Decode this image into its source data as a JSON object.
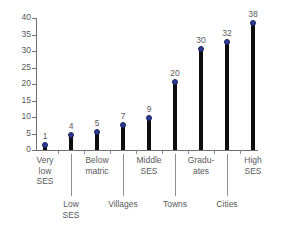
{
  "chart_data": {
    "type": "bar",
    "title": "",
    "subtitle": "",
    "xlabel": "",
    "ylabel": "",
    "ylim": [
      0,
      40
    ],
    "ytick_step": 5,
    "grid": false,
    "legend": "none",
    "marker_style": "circle",
    "categories": [
      "Very\nlow\nSES",
      "Low\nSES",
      "Below\nmatric",
      "Villages",
      "Middle\nSES",
      "Towns",
      "Gradu-\nates",
      "Cities",
      "High\nSES"
    ],
    "values": [
      1,
      4,
      5,
      7,
      9,
      20,
      30,
      32,
      38
    ],
    "yticks": [
      "0",
      "5",
      "10",
      "15",
      "20",
      "25",
      "30",
      "35",
      "40"
    ],
    "ytick_values": [
      0,
      5,
      10,
      15,
      20,
      25,
      30,
      35,
      40
    ],
    "data_labels": [
      "1",
      "4",
      "5",
      "7",
      "9",
      "20",
      "30",
      "32",
      "38"
    ],
    "top_row_labels": [
      {
        "text": "Very\nlow\nSES",
        "index": 0
      },
      {
        "text": "Below\nmatric",
        "index": 2
      },
      {
        "text": "Middle\nSES",
        "index": 4
      },
      {
        "text": "Gradu-\nates",
        "index": 6
      },
      {
        "text": "High\nSES",
        "index": 8
      }
    ],
    "bottom_row_labels": [
      {
        "text": "Low\nSES",
        "index": 1
      },
      {
        "text": "Villages",
        "index": 3
      },
      {
        "text": "Towns",
        "index": 5
      },
      {
        "text": "Cities",
        "index": 7
      }
    ],
    "colors": {
      "bar": "#0d0d0d",
      "marker": "#2b3a8f",
      "axis": "#6f7072",
      "text": "#58595b",
      "background": "#ffffff"
    }
  }
}
